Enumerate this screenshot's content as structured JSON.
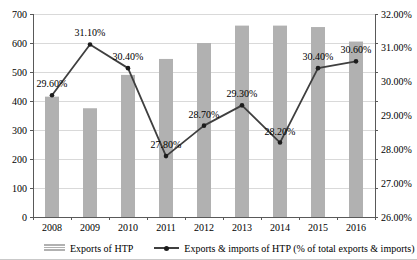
{
  "chart_data": {
    "type": "combo",
    "categories": [
      "2008",
      "2009",
      "2010",
      "2011",
      "2012",
      "2013",
      "2014",
      "2015",
      "2016"
    ],
    "series": [
      {
        "name": "Exports of HTP",
        "type": "bar",
        "axis": "left",
        "values": [
          415,
          375,
          490,
          545,
          600,
          660,
          660,
          655,
          605
        ]
      },
      {
        "name": "Exports & imports of HTP (% of total exports & imports)",
        "type": "line",
        "axis": "right",
        "values": [
          29.6,
          31.1,
          30.4,
          27.8,
          28.7,
          29.3,
          28.2,
          30.4,
          30.6
        ],
        "point_labels": [
          "29.60%",
          "31.10%",
          "30.40%",
          "27.80%",
          "28.70%",
          "29.30%",
          "28.20%",
          "30.40%",
          "30.60%"
        ]
      }
    ],
    "left_axis": {
      "min": 0,
      "max": 700,
      "step": 100,
      "tick_labels": [
        "0",
        "100",
        "200",
        "300",
        "400",
        "500",
        "600",
        "700"
      ]
    },
    "right_axis": {
      "min": 26,
      "max": 32,
      "step": 1,
      "tick_labels": [
        "26.00%",
        "27.00%",
        "28.00%",
        "29.00%",
        "30.00%",
        "31.00%",
        "32.00%"
      ]
    },
    "title": "",
    "xlabel": "",
    "ylabel": "",
    "grid": true,
    "legend_position": "bottom",
    "colors": {
      "bar": "#b1b1b1",
      "line": "#3f3f3f",
      "marker": "#1c1c1c",
      "gridline": "#d9d9d9",
      "axis": "#595959",
      "text": "#000000"
    }
  }
}
